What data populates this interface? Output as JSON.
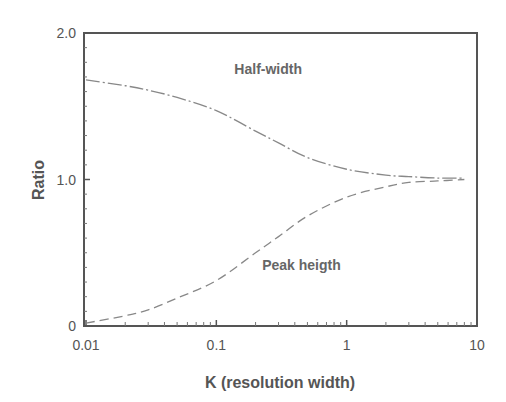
{
  "chart_data": {
    "type": "line",
    "title": "",
    "xlabel": "K (resolution width)",
    "ylabel": "Ratio",
    "xscale": "log",
    "xlim": [
      0.01,
      10
    ],
    "ylim": [
      0,
      2.0
    ],
    "xticks": [
      0.01,
      0.1,
      1,
      10
    ],
    "xtick_labels": [
      "0.01",
      "0.1",
      "1",
      "10"
    ],
    "yticks": [
      0,
      1.0,
      2.0
    ],
    "ytick_labels": [
      "0",
      "1.0",
      "2.0"
    ],
    "grid": false,
    "legend": "none",
    "series": [
      {
        "name": "Half-width",
        "style": "dash-dot",
        "x": [
          0.01,
          0.02,
          0.03,
          0.05,
          0.1,
          0.2,
          0.3,
          0.5,
          1,
          2,
          3,
          5,
          8
        ],
        "y": [
          1.68,
          1.64,
          1.61,
          1.56,
          1.47,
          1.33,
          1.25,
          1.15,
          1.07,
          1.03,
          1.02,
          1.01,
          1.01
        ]
      },
      {
        "name": "Peak heigth",
        "style": "dashed",
        "x": [
          0.01,
          0.02,
          0.03,
          0.05,
          0.1,
          0.2,
          0.3,
          0.5,
          1,
          2,
          3,
          5,
          8
        ],
        "y": [
          0.02,
          0.07,
          0.11,
          0.19,
          0.31,
          0.5,
          0.61,
          0.75,
          0.88,
          0.95,
          0.98,
          0.99,
          1.0
        ]
      }
    ],
    "annotations": [
      {
        "text": "Half-width",
        "x": 0.25,
        "y": 1.72
      },
      {
        "text": "Peak heigth",
        "x": 0.45,
        "y": 0.38
      }
    ]
  }
}
